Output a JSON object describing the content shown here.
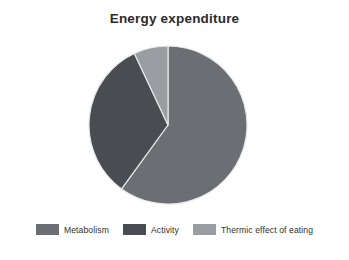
{
  "chart_data": {
    "type": "pie",
    "title": "Energy expenditure",
    "xlabel": "",
    "ylabel": "",
    "legend_position": "bottom",
    "grid": false,
    "start_angle_deg": 0,
    "direction": "clockwise",
    "categories": [
      "Metabolism",
      "Activity",
      "Thermic effect of eating"
    ],
    "values": [
      60,
      33,
      7
    ],
    "units": "percent",
    "slices": [
      {
        "label": "Metabolism",
        "value": 60,
        "color": "#6b6e72",
        "start_angle_deg": 0,
        "end_angle_deg": 216
      },
      {
        "label": "Activity",
        "value": 33,
        "color": "#494d52",
        "start_angle_deg": 216,
        "end_angle_deg": 334.8
      },
      {
        "label": "Thermic effect of eating",
        "value": 7,
        "color": "#9a9da1",
        "start_angle_deg": 334.8,
        "end_angle_deg": 360
      }
    ],
    "geometry": {
      "center_x": 80,
      "center_y": 80,
      "radius": 79,
      "separator_color": "#e8e8e8",
      "separator_width": 1.2
    }
  },
  "legend": {
    "items": [
      {
        "label": "Metabolism",
        "color": "#6b6e72"
      },
      {
        "label": "Activity",
        "color": "#494d52"
      },
      {
        "label": "Thermic effect of eating",
        "color": "#9a9da1"
      }
    ]
  }
}
